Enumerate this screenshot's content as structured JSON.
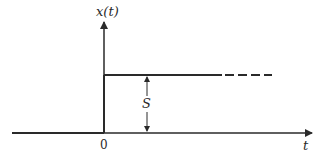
{
  "diagram": {
    "type": "step-function",
    "y_axis_label": "x(t)",
    "x_axis_label": "t",
    "origin_label": "0",
    "amplitude_label": "S",
    "colors": {
      "line": "#2a2a2a",
      "background": "#ffffff"
    }
  }
}
